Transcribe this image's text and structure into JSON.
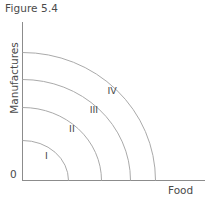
{
  "figure": {
    "title": "Figure 5.4",
    "origin_label": "0",
    "x_axis_label": "Food",
    "y_axis_label": "Manufactures"
  },
  "colors": {
    "axis": "#8c8c8c",
    "curve": "#aaaaaa",
    "text": "#4a4a4a",
    "background": "#ffffff"
  },
  "chart_data": {
    "type": "line",
    "title": "Figure 5.4",
    "xlabel": "Food",
    "ylabel": "Manufactures",
    "grid": false,
    "legend": "inline-labels",
    "xlim": [
      0,
      1
    ],
    "ylim": [
      0,
      1
    ],
    "axis_ticks": [],
    "series": [
      {
        "name": "I",
        "label": "I",
        "y_intercept": 0.25,
        "x_intercept": 0.29,
        "label_position": {
          "x": 0.13,
          "y": 0.16
        }
      },
      {
        "name": "II",
        "label": "II",
        "y_intercept": 0.46,
        "x_intercept": 0.5,
        "label_position": {
          "x": 0.27,
          "y": 0.33
        }
      },
      {
        "name": "III",
        "label": "III",
        "y_intercept": 0.64,
        "x_intercept": 0.66,
        "label_position": {
          "x": 0.39,
          "y": 0.45
        }
      },
      {
        "name": "IV",
        "label": "IV",
        "y_intercept": 0.81,
        "x_intercept": 0.8,
        "label_position": {
          "x": 0.49,
          "y": 0.57
        }
      }
    ]
  }
}
